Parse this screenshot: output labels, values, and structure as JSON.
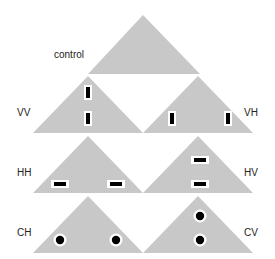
{
  "diagram": {
    "colors": {
      "triangle_fill": "#c8c8c8",
      "marker_fill": "#000000",
      "marker_halo": "#ffffff",
      "label_color": "#222222"
    },
    "panels": [
      {
        "id": "control",
        "label": "control",
        "marker_type": "none",
        "marker_count": 0
      },
      {
        "id": "VV",
        "label": "VV",
        "marker_type": "vertical-bar",
        "arrangement": "vertical",
        "marker_count": 2
      },
      {
        "id": "VH",
        "label": "VH",
        "marker_type": "vertical-bar",
        "arrangement": "horizontal",
        "marker_count": 2
      },
      {
        "id": "HH",
        "label": "HH",
        "marker_type": "horizontal-bar",
        "arrangement": "horizontal",
        "marker_count": 2
      },
      {
        "id": "HV",
        "label": "HV",
        "marker_type": "horizontal-bar",
        "arrangement": "vertical",
        "marker_count": 2
      },
      {
        "id": "CH",
        "label": "CH",
        "marker_type": "circle",
        "arrangement": "horizontal",
        "marker_count": 2
      },
      {
        "id": "CV",
        "label": "CV",
        "marker_type": "circle",
        "arrangement": "vertical",
        "marker_count": 2
      }
    ]
  }
}
